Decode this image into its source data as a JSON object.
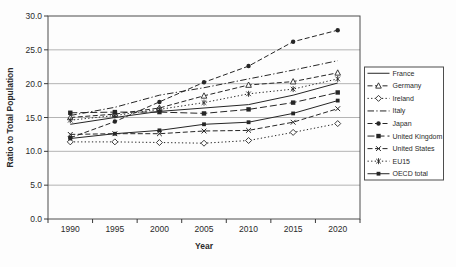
{
  "chart_data": {
    "type": "line",
    "title": "",
    "xlabel": "Year",
    "ylabel": "Ratio to Total Population",
    "x": [
      1990,
      1995,
      2000,
      2005,
      2010,
      2015,
      2020
    ],
    "xtick_labels": [
      "1990",
      "1995",
      "2000",
      "2005",
      "2010",
      "2015",
      "2020"
    ],
    "ylim": [
      0,
      30
    ],
    "ytick_step": 5,
    "ytick_labels": [
      "0.0",
      "5.0",
      "10.0",
      "15.0",
      "20.0",
      "25.0",
      "30.0"
    ],
    "grid": true,
    "legend_position": "right",
    "series": [
      {
        "name": "France",
        "line": "solid",
        "marker": "none",
        "values": [
          14.0,
          15.0,
          15.9,
          16.4,
          16.9,
          18.3,
          20.1
        ]
      },
      {
        "name": "Germany",
        "line": "dash",
        "marker": "triangle-open",
        "values": [
          15.0,
          15.5,
          16.4,
          18.2,
          19.8,
          20.3,
          21.6
        ]
      },
      {
        "name": "Ireland",
        "line": "dot",
        "marker": "diamond-open",
        "values": [
          11.4,
          11.4,
          11.3,
          11.2,
          11.6,
          12.8,
          14.1
        ]
      },
      {
        "name": "Italy",
        "line": "dashdot",
        "marker": "none",
        "values": [
          15.3,
          16.5,
          18.3,
          19.4,
          20.7,
          22.0,
          23.4
        ]
      },
      {
        "name": "Japan",
        "line": "dash",
        "marker": "circle-filled",
        "values": [
          12.0,
          14.4,
          17.3,
          20.2,
          22.6,
          26.2,
          27.9
        ]
      },
      {
        "name": "United Kingdom",
        "line": "longdash",
        "marker": "square-filled",
        "values": [
          15.7,
          15.8,
          15.8,
          15.6,
          16.2,
          17.2,
          18.7
        ]
      },
      {
        "name": "United States",
        "line": "dash",
        "marker": "x",
        "values": [
          12.5,
          12.6,
          12.6,
          13.0,
          13.1,
          14.3,
          16.3
        ]
      },
      {
        "name": "EU15",
        "line": "dot",
        "marker": "asterisk",
        "values": [
          14.6,
          15.3,
          16.2,
          17.2,
          18.5,
          19.2,
          20.7
        ]
      },
      {
        "name": "OECD total",
        "line": "solid",
        "marker": "square-filled-small",
        "values": [
          11.9,
          12.6,
          13.1,
          14.0,
          14.3,
          15.6,
          17.5
        ]
      }
    ]
  },
  "colors": {
    "series_line": "#262626",
    "grid": "#ababab",
    "plot_border": "#4d4d4d",
    "axis": "#3a3a3a",
    "legend_border": "#4d4d4d",
    "background": "#fdfdfd"
  }
}
